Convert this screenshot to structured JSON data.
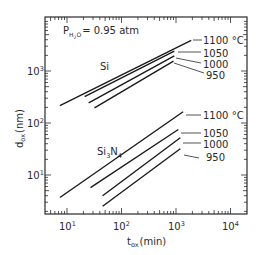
{
  "chart_data": {
    "type": "line",
    "title": "",
    "xlabel": "t_ox (min)",
    "ylabel": "d_ox (nm)",
    "xscale": "log",
    "yscale": "log",
    "xlim": [
      4.5,
      15000
    ],
    "ylim": [
      2.5,
      8000
    ],
    "grid": false,
    "x_ticks": [
      "10^1",
      "10^2",
      "10^3",
      "10^4"
    ],
    "y_ticks": [
      "10^1",
      "10^2",
      "10^3"
    ],
    "annotations": {
      "condition": "P_H2O = 0.95 atm",
      "group_labels": [
        "Si",
        "Si3N4"
      ]
    },
    "series": [
      {
        "name": "Si 1100 °C",
        "group": "Si",
        "temp_label": "1100 °C",
        "x": [
          7.4,
          1900
        ],
        "y": [
          215,
          3900
        ]
      },
      {
        "name": "Si 1050 °C",
        "group": "Si",
        "temp_label": "1050",
        "x": [
          21,
          930
        ],
        "y": [
          320,
          2400
        ]
      },
      {
        "name": "Si 1000 °C",
        "group": "Si",
        "temp_label": "1000",
        "x": [
          25,
          930
        ],
        "y": [
          245,
          1950
        ]
      },
      {
        "name": "Si 950 °C",
        "group": "Si",
        "temp_label": "950",
        "x": [
          32,
          900
        ],
        "y": [
          195,
          1550
        ]
      },
      {
        "name": "Si3N4 1100 °C",
        "group": "Si3N4",
        "temp_label": "1100 °C",
        "x": [
          7.4,
          1350
        ],
        "y": [
          3.7,
          165
        ]
      },
      {
        "name": "Si3N4 1050 °C",
        "group": "Si3N4",
        "temp_label": "1050",
        "x": [
          27,
          1100
        ],
        "y": [
          5.7,
          75
        ]
      },
      {
        "name": "Si3N4 1000 °C",
        "group": "Si3N4",
        "temp_label": "1000",
        "x": [
          45,
          1200
        ],
        "y": [
          4.0,
          52
        ]
      },
      {
        "name": "Si3N4 950 °C",
        "group": "Si3N4",
        "temp_label": "950",
        "x": [
          45,
          1200
        ],
        "y": [
          2.5,
          32
        ]
      }
    ]
  },
  "labels": {
    "condition_p": "P",
    "condition_sub": "H",
    "condition_sub2": "2",
    "condition_sub3": "O",
    "condition_rest": "= 0.95 atm",
    "si": "Si",
    "si3n4_a": "Si",
    "si3n4_sub1": "3",
    "si3n4_b": "N",
    "si3n4_sub2": "4",
    "x_axis_main": "t",
    "x_axis_sub": "ox",
    "x_axis_unit": "(min)",
    "y_axis_main": "d",
    "y_axis_sub": "ox",
    "y_axis_unit": "(nm)",
    "si_temps": [
      "1100 °C",
      "1050",
      "1000",
      "950"
    ],
    "nit_temps": [
      "1100 °C",
      "1050",
      "1000",
      "950"
    ],
    "x_ticks": [
      {
        "base": "10",
        "exp": "1"
      },
      {
        "base": "10",
        "exp": "2"
      },
      {
        "base": "10",
        "exp": "3"
      },
      {
        "base": "10",
        "exp": "4"
      }
    ],
    "y_ticks": [
      {
        "base": "10",
        "exp": "1"
      },
      {
        "base": "10",
        "exp": "2"
      },
      {
        "base": "10",
        "exp": "3"
      }
    ]
  }
}
